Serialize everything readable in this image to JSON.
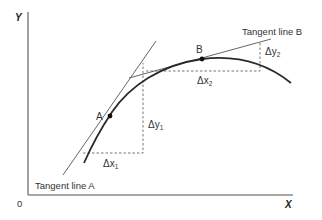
{
  "diagram": {
    "axes": {
      "y_label": "Y",
      "x_label": "X",
      "origin_label": "0"
    },
    "points": {
      "a": {
        "label": "A"
      },
      "b": {
        "label": "B"
      }
    },
    "tangents": {
      "a": {
        "label": "Tangent line A"
      },
      "b": {
        "label": "Tangent line B"
      }
    },
    "deltas": {
      "dx1": {
        "symbol": "Δx",
        "sub": "1"
      },
      "dy1": {
        "symbol": "Δy",
        "sub": "1"
      },
      "dx2": {
        "symbol": "Δx",
        "sub": "2"
      },
      "dy2": {
        "symbol": "Δy",
        "sub": "2"
      }
    },
    "colors": {
      "curve": "#2a2a2a",
      "axis": "#8a8a8a",
      "tangent": "#555555",
      "dashed": "#666666"
    }
  }
}
